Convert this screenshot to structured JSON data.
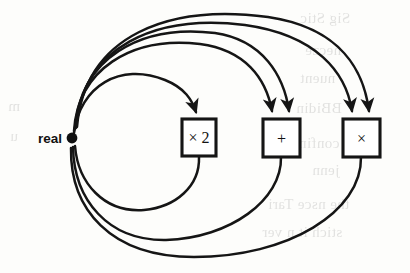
{
  "figure": {
    "background_color": "#fdfdfb",
    "ink_color": "#151515",
    "source_node": {
      "id": "real",
      "label": "real",
      "x": 72,
      "y": 138,
      "dot_radius": 5.4,
      "label_x": 62,
      "label_y": 143
    },
    "boxes": [
      {
        "id": "times-two",
        "label": "× 2",
        "x": 182,
        "y": 119,
        "width": 34,
        "height": 37,
        "inputs": 1,
        "outputs": 1
      },
      {
        "id": "plus",
        "label": "+",
        "x": 263,
        "y": 119,
        "width": 37,
        "height": 38,
        "inputs": 2,
        "outputs": 1
      },
      {
        "id": "times",
        "label": "×",
        "x": 343,
        "y": 119,
        "width": 37,
        "height": 38,
        "inputs": 2,
        "outputs": 1
      }
    ],
    "forward_edges": [
      {
        "id": "real-to-times-two",
        "from": "real",
        "to": "times-two",
        "arrowhead": true,
        "path": "M 74 133 C 80 86, 120 62, 165 80 C 185 88, 192 100, 196 112"
      },
      {
        "id": "real-to-plus-a",
        "from": "real",
        "to": "plus",
        "arrowhead": true,
        "path": "M 74 131 C 78 70, 130 36, 200 44 C 245 50, 266 78, 272 111"
      },
      {
        "id": "real-to-plus-b",
        "from": "real",
        "to": "plus",
        "arrowhead": true,
        "path": "M 75 129 C 80 58, 140 24, 215 33 C 263 40, 284 76, 289 111"
      },
      {
        "id": "real-to-times-a",
        "from": "real",
        "to": "times",
        "arrowhead": true,
        "path": "M 76 128 C 82 46, 156 14, 245 25 C 316 35, 346 72, 352 111"
      },
      {
        "id": "real-to-times-b",
        "from": "real",
        "to": "times",
        "arrowhead": true,
        "path": "M 77 127 C 85 34, 170 4, 268 17 C 342 28, 364 72, 369 111"
      }
    ],
    "return_edges": [
      {
        "id": "times-two-to-real",
        "from": "times-two",
        "to": "real",
        "arrowhead": false,
        "path": "M 199 157 C 200 186, 176 207, 144 210 C 104 213, 78 183, 75 146"
      },
      {
        "id": "plus-to-real",
        "from": "plus",
        "to": "real",
        "arrowhead": false,
        "path": "M 281 157 C 282 200, 230 238, 166 240 C 108 241, 74 200, 73 147"
      },
      {
        "id": "times-to-real",
        "from": "times",
        "to": "real",
        "arrowhead": false,
        "path": "M 361 157 C 362 212, 288 257, 194 257 C 110 257, 70 209, 71 148"
      }
    ]
  },
  "page_bleed": [
    {
      "text": "Sig Stic",
      "x": 300,
      "y": 10
    },
    {
      "text": "necze",
      "x": 305,
      "y": 42
    },
    {
      "text": "nuent",
      "x": 300,
      "y": 70
    },
    {
      "text": "BBidin",
      "x": 296,
      "y": 100
    },
    {
      "text": "confin ere",
      "x": 275,
      "y": 135
    },
    {
      "text": "jenn",
      "x": 312,
      "y": 162
    },
    {
      "text": "the nsce Tari",
      "x": 268,
      "y": 196
    },
    {
      "text": "stich it n ver",
      "x": 262,
      "y": 224
    },
    {
      "text": "m",
      "x": 8,
      "y": 98
    },
    {
      "text": "u",
      "x": 10,
      "y": 128
    }
  ]
}
